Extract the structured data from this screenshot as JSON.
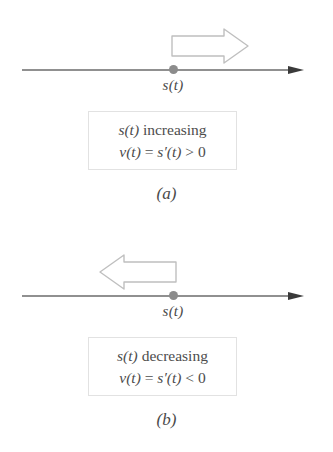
{
  "figure": {
    "background_color": "#ffffff",
    "line_color": "#6b6b6b",
    "dot_color": "#8c8c8c",
    "arrow_outline_color": "#b8b8b8",
    "box_border_color": "#e2e2e2",
    "text_color": "#4d4d4d"
  },
  "panels": [
    {
      "id": "a",
      "caption": "(a)",
      "direction": "right",
      "arrow_icon": "block-arrow-right-icon",
      "point_label": "s(t)",
      "statement": {
        "line1_var": "s(t)",
        "line1_word": "increasing",
        "line2": "v(t) = s′(t) > 0",
        "line2_lhs": "v(t)",
        "line2_eq": "=",
        "line2_rhs": "s′(t)",
        "line2_rel": ">",
        "line2_value": "0"
      }
    },
    {
      "id": "b",
      "caption": "(b)",
      "direction": "left",
      "arrow_icon": "block-arrow-left-icon",
      "point_label": "s(t)",
      "statement": {
        "line1_var": "s(t)",
        "line1_word": "decreasing",
        "line2": "v(t) = s′(t) < 0",
        "line2_lhs": "v(t)",
        "line2_eq": "=",
        "line2_rhs": "s′(t)",
        "line2_rel": "<",
        "line2_value": "0"
      }
    }
  ]
}
